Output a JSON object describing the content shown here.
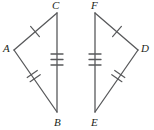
{
  "figure": {
    "type": "geometry-diagram",
    "stroke_color": "#58595b",
    "label_color": "#231f20",
    "background_color": "#ffffff",
    "stroke_width": 1.3,
    "triangles": [
      {
        "name": "triangle-ABC",
        "vertices": [
          {
            "label": "A",
            "x": 14,
            "y": 50
          },
          {
            "label": "C",
            "x": 57,
            "y": 13
          },
          {
            "label": "B",
            "x": 57,
            "y": 112
          }
        ],
        "sides": [
          {
            "name": "side-AC",
            "from": "A",
            "to": "C",
            "ticks": 1
          },
          {
            "name": "side-CB",
            "from": "C",
            "to": "B",
            "ticks": 3
          },
          {
            "name": "side-AB",
            "from": "A",
            "to": "B",
            "ticks": 2
          }
        ]
      },
      {
        "name": "triangle-DEF",
        "vertices": [
          {
            "label": "F",
            "x": 95,
            "y": 13
          },
          {
            "label": "D",
            "x": 138,
            "y": 50
          },
          {
            "label": "E",
            "x": 95,
            "y": 112
          }
        ],
        "sides": [
          {
            "name": "side-FD",
            "from": "F",
            "to": "D",
            "ticks": 1
          },
          {
            "name": "side-FE",
            "from": "F",
            "to": "E",
            "ticks": 3
          },
          {
            "name": "side-ED",
            "from": "E",
            "to": "D",
            "ticks": 2
          }
        ]
      }
    ],
    "labels": [
      {
        "name": "vertex-label-A",
        "text": "A",
        "x": 3,
        "y": 43
      },
      {
        "name": "vertex-label-C",
        "text": "C",
        "x": 52,
        "y": 0
      },
      {
        "name": "vertex-label-B",
        "text": "B",
        "x": 54,
        "y": 117
      },
      {
        "name": "vertex-label-F",
        "text": "F",
        "x": 91,
        "y": 0
      },
      {
        "name": "vertex-label-D",
        "text": "D",
        "x": 141,
        "y": 43
      },
      {
        "name": "vertex-label-E",
        "text": "E",
        "x": 91,
        "y": 117
      }
    ]
  }
}
